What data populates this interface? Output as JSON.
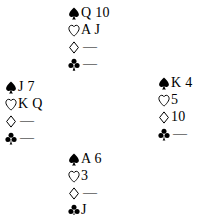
{
  "diagram": {
    "type": "bridge-hand-diagram",
    "void_marker": "—",
    "suit_order": [
      "spades",
      "hearts",
      "diamonds",
      "clubs"
    ],
    "suit_symbols": {
      "spades": "♠",
      "hearts": "♡",
      "diamonds": "♢",
      "clubs": "♣"
    },
    "colors": {
      "ink": "#000000",
      "background": "#ffffff"
    }
  },
  "hands": {
    "north": {
      "position_label": "North",
      "spades": "Q 10",
      "hearts": "A J",
      "diamonds": "—",
      "clubs": "—"
    },
    "west": {
      "position_label": "West",
      "spades": "J 7",
      "hearts": "K Q",
      "diamonds": "—",
      "clubs": "—"
    },
    "east": {
      "position_label": "East",
      "spades": "K 4",
      "hearts": "5",
      "diamonds": "10",
      "clubs": "—"
    },
    "south": {
      "position_label": "South",
      "spades": "A 6",
      "hearts": "3",
      "diamonds": "—",
      "clubs": "J"
    }
  }
}
